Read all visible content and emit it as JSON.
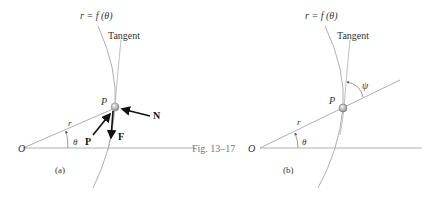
{
  "figure": {
    "caption": "Fig. 13–17",
    "panels": [
      {
        "id": "a",
        "label": "(a)",
        "curve_label": "r = f (θ)",
        "tangent_label": "Tangent",
        "origin_label": "O",
        "point_label": "P",
        "radius_label": "r",
        "angle_label": "θ",
        "forces": [
          "N",
          "P",
          "F"
        ]
      },
      {
        "id": "b",
        "label": "(b)",
        "curve_label": "r = f (θ)",
        "tangent_label": "Tangent",
        "origin_label": "O",
        "point_label": "P",
        "radius_label": "r",
        "angle_label": "θ",
        "tangent_angle_label": "ψ"
      }
    ],
    "colors": {
      "line": "#9a9a9a",
      "force_arrow": "#111111",
      "particle": "#bdbdbd"
    }
  }
}
